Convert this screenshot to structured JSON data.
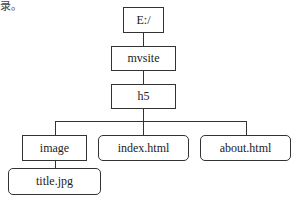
{
  "caption_fragment": "录。",
  "tree": {
    "root": {
      "label": "E:/",
      "type": "folder"
    },
    "level1": {
      "label": "mvsite",
      "type": "folder"
    },
    "level2": {
      "label": "h5",
      "type": "folder"
    },
    "level3": [
      {
        "label": "image",
        "type": "folder"
      },
      {
        "label": "index.html",
        "type": "file"
      },
      {
        "label": "about.html",
        "type": "file"
      }
    ],
    "level4": [
      {
        "label": "title.jpg",
        "type": "file",
        "parent": "image"
      }
    ]
  }
}
